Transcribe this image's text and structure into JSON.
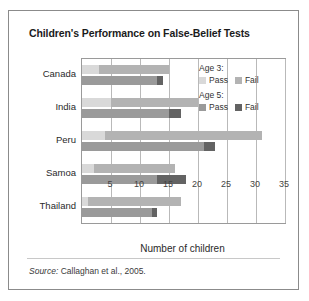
{
  "figure": {
    "title": "Children's Performance on False-Belief Tests",
    "source_prefix": "Source:",
    "source_text": "Callaghan et al., 2005."
  },
  "legend": {
    "groups": [
      {
        "heading": "Age 3:",
        "items": [
          {
            "label": "Pass",
            "color": "#d9d9d9"
          },
          {
            "label": "Fail",
            "color": "#b3b3b3"
          }
        ]
      },
      {
        "heading": "Age 5:",
        "items": [
          {
            "label": "Pass",
            "color": "#9a9a9a"
          },
          {
            "label": "Fail",
            "color": "#636363"
          }
        ]
      }
    ]
  },
  "colors": {
    "age3_pass": "#d9d9d9",
    "age3_fail": "#b3b3b3",
    "age5_pass": "#9a9a9a",
    "age5_fail": "#636363",
    "grid": "#b9b9b9",
    "frame": "#8b8b8b"
  },
  "chart_data": {
    "type": "bar",
    "orientation": "horizontal",
    "stacked": true,
    "title": "Children's Performance on False-Belief Tests",
    "xlabel": "Number of children",
    "ylabel": "",
    "xlim": [
      0,
      35
    ],
    "xticks": [
      5,
      10,
      15,
      20,
      25,
      30,
      35
    ],
    "xtick_labels": [
      "5",
      "10",
      "15",
      "20",
      "25",
      "30",
      "35"
    ],
    "grid": true,
    "legend_position": "inside-right",
    "categories": [
      "Canada",
      "India",
      "Peru",
      "Samoa",
      "Thailand"
    ],
    "series": [
      {
        "name": "Age 3: Pass",
        "color": "#d9d9d9",
        "values": [
          3,
          5,
          4,
          2,
          1
        ]
      },
      {
        "name": "Age 3: Fail",
        "color": "#b3b3b3",
        "values": [
          12,
          15,
          27,
          14,
          16
        ]
      },
      {
        "name": "Age 5: Pass",
        "color": "#9a9a9a",
        "values": [
          13,
          15,
          21,
          13,
          12
        ]
      },
      {
        "name": "Age 5: Fail",
        "color": "#636363",
        "values": [
          1,
          2,
          2,
          5,
          1
        ]
      }
    ],
    "totals": {
      "age3": [
        15,
        20,
        31,
        16,
        17
      ],
      "age5": [
        14,
        17,
        23,
        18,
        13
      ]
    }
  }
}
